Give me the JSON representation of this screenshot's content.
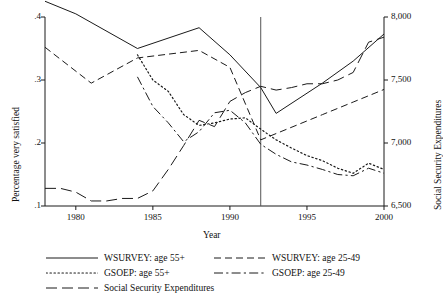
{
  "figure": {
    "background": "#ffffff",
    "line_color": "#1a1a1a",
    "vline_year": 1992
  },
  "axes": {
    "x": {
      "label": "Year",
      "ticks": [
        1980,
        1985,
        1990,
        1995,
        2000
      ],
      "tick_labels": [
        "1980",
        "1985",
        "1990",
        "1995",
        "2000"
      ],
      "range": [
        1978,
        2000
      ]
    },
    "y_left": {
      "label": "Percentage very satisfied",
      "ticks": [
        0.1,
        0.2,
        0.3,
        0.4
      ],
      "tick_labels": [
        ".1",
        ".2",
        ".3",
        ".4"
      ],
      "range": [
        0.1,
        0.4
      ]
    },
    "y_right": {
      "label": "Social Security Expenditures",
      "ticks": [
        6500,
        7000,
        7500,
        8000
      ],
      "tick_labels": [
        "6,500",
        "7,000",
        "7,500",
        "8,000"
      ],
      "range": [
        6500,
        8000
      ]
    }
  },
  "legend": {
    "rows": [
      [
        {
          "name": "wsurvey-55plus",
          "label": "WSURVEY: age 55+",
          "style": "solid"
        },
        {
          "name": "wsurvey-25-49",
          "label": "WSURVEY: age 25-49",
          "style": "dashed"
        }
      ],
      [
        {
          "name": "gsoep-55plus",
          "label": "GSOEP: age 55+",
          "style": "dotted"
        },
        {
          "name": "gsoep-25-49",
          "label": "GSOEP: age 25-49",
          "style": "dashdot"
        }
      ],
      [
        {
          "name": "social-security",
          "label": "Social Security Expenditures",
          "style": "longdash"
        }
      ]
    ]
  },
  "chart_data": {
    "type": "line",
    "title": "",
    "xlabel": "Year",
    "ylabel": "Percentage very satisfied",
    "ylabel_right": "Social Security Expenditures",
    "xlim": [
      1978,
      2000
    ],
    "ylim": [
      0.1,
      0.4
    ],
    "ylim_right": [
      6500,
      8000
    ],
    "grid": false,
    "legend_position": "below",
    "annotations": [
      {
        "type": "vline",
        "x": 1992,
        "label": "German reunification survey break"
      }
    ],
    "series": [
      {
        "name": "WSURVEY: age 55+",
        "style": "solid",
        "axis": "left",
        "x": [
          1978,
          1980,
          1984,
          1988,
          1990,
          1992,
          1993,
          1996,
          1998,
          2000
        ],
        "values": [
          0.425,
          0.405,
          0.35,
          0.383,
          0.34,
          0.288,
          0.247,
          0.295,
          0.33,
          0.373
        ]
      },
      {
        "name": "WSURVEY: age 25-49",
        "style": "dashed",
        "axis": "left",
        "x": [
          1978,
          1981,
          1984,
          1988,
          1990,
          1992,
          1993,
          1996,
          1998,
          2000
        ],
        "values": [
          0.352,
          0.295,
          0.335,
          0.347,
          0.32,
          0.205,
          0.215,
          0.245,
          0.265,
          0.285
        ]
      },
      {
        "name": "GSOEP: age 55+",
        "style": "dotted",
        "axis": "left",
        "x": [
          1984,
          1985,
          1986,
          1987,
          1988,
          1989,
          1990,
          1991,
          1992,
          1993,
          1994,
          1995,
          1996,
          1997,
          1998,
          1999,
          2000
        ],
        "values": [
          0.34,
          0.3,
          0.282,
          0.245,
          0.228,
          0.232,
          0.238,
          0.24,
          0.222,
          0.205,
          0.192,
          0.18,
          0.172,
          0.16,
          0.152,
          0.168,
          0.158
        ]
      },
      {
        "name": "GSOEP: age 25-49",
        "style": "dashdot",
        "axis": "left",
        "x": [
          1984,
          1985,
          1986,
          1987,
          1988,
          1989,
          1990,
          1991,
          1992,
          1993,
          1994,
          1995,
          1996,
          1997,
          1998,
          1999,
          2000
        ],
        "values": [
          0.305,
          0.258,
          0.232,
          0.202,
          0.218,
          0.248,
          0.252,
          0.232,
          0.198,
          0.182,
          0.17,
          0.165,
          0.158,
          0.15,
          0.148,
          0.16,
          0.152
        ]
      },
      {
        "name": "Social Security Expenditures",
        "style": "longdash",
        "axis": "right",
        "x": [
          1978,
          1979,
          1980,
          1981,
          1982,
          1983,
          1984,
          1985,
          1986,
          1987,
          1988,
          1989,
          1990,
          1991,
          1992,
          1993,
          1994,
          1995,
          1996,
          1997,
          1998,
          1999,
          2000
        ],
        "values": [
          6640,
          6640,
          6610,
          6540,
          6540,
          6560,
          6560,
          6620,
          6790,
          6980,
          7180,
          7130,
          7330,
          7400,
          7450,
          7420,
          7440,
          7470,
          7470,
          7500,
          7560,
          7800,
          7840
        ]
      }
    ]
  }
}
